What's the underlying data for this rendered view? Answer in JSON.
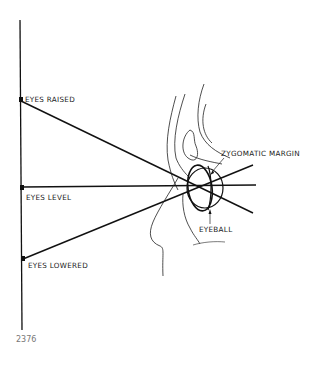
{
  "diagram": {
    "labels": {
      "eyes_raised": "EYES RAISED",
      "eyes_level": "EYES LEVEL",
      "eyes_lowered": "EYES LOWERED",
      "zygomatic_margin": "ZYGOMATIC  MARGIN",
      "eyeball": "EYEBALL"
    },
    "figure_number": "2376",
    "stroke_color": "#111111",
    "background": "#ffffff"
  }
}
